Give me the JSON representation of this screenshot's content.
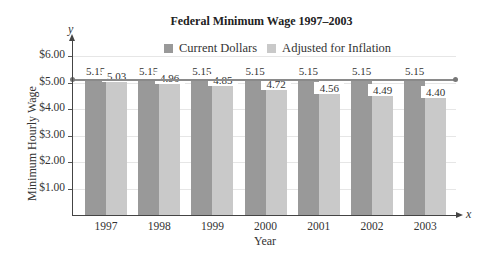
{
  "chart_data": {
    "type": "bar",
    "title": "Federal Minimum Wage 1997–2003",
    "xlabel": "Year",
    "ylabel": "Minimum Hourly Wage",
    "x_axis_variable": "x",
    "y_axis_variable": "y",
    "categories": [
      "1997",
      "1998",
      "1999",
      "2000",
      "2001",
      "2002",
      "2003"
    ],
    "series": [
      {
        "name": "Current Dollars",
        "color": "#999999",
        "values": [
          5.15,
          5.15,
          5.15,
          5.15,
          5.15,
          5.15,
          5.15
        ],
        "labels": [
          "5.15",
          "5.15",
          "5.15",
          "5.15",
          "5.15",
          "5.15",
          "5.15"
        ]
      },
      {
        "name": "Adjusted for Inflation",
        "color": "#c9c9c9",
        "values": [
          5.03,
          4.96,
          4.85,
          4.72,
          4.56,
          4.49,
          4.4
        ],
        "labels": [
          "5.03",
          "4.96",
          "4.85",
          "4.72",
          "4.56",
          "4.49",
          "4.40"
        ]
      }
    ],
    "ylim": [
      0,
      6
    ],
    "yticks": [
      "$1.00",
      "$2.00",
      "$3.00",
      "$4.00",
      "$5.00",
      "$6.00"
    ],
    "ytick_values": [
      1,
      2,
      3,
      4,
      5,
      6
    ],
    "grid": true,
    "legend_position": "top-center",
    "reference_line": {
      "value": 5.15,
      "description": "horizontal line at 5.15 with endpoint dots"
    }
  }
}
